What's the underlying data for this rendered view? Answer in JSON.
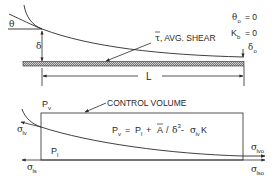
{
  "top_panel": {
    "theta_label": "θ",
    "delta_label": "δ",
    "length_label": "L",
    "shear_symbol": "τ",
    "shear_text": ", AVG. SHEAR",
    "end_conditions": {
      "theta_o": {
        "sym": "θ",
        "sub": "o",
        "eq": "= 0"
      },
      "K_b": {
        "sym": "K",
        "sub": "b",
        "eq": "= 0"
      },
      "delta_o": {
        "sym": "δ",
        "sub": "o"
      }
    }
  },
  "bottom_panel": {
    "control_volume_label": "CONTROL VOLUME",
    "Pv_label": {
      "sym": "P",
      "sub": "v"
    },
    "Pl_label": {
      "sym": "P",
      "sub": "l"
    },
    "equation": {
      "lhs_sym": "P",
      "lhs_sub": "v",
      "eq1": "=",
      "p_sym": "P",
      "p_sub": "l",
      "plus": "+",
      "A_sym": "A",
      "slash": "/",
      "delta_sym": "δ",
      "delta_pow": "3",
      "minus": "-",
      "sigma_sym": "σ",
      "sigma_sub": "lv",
      "K_sym": "K"
    },
    "stresses": {
      "sigma_lv": {
        "sym": "σ",
        "sub": "lv"
      },
      "sigma_ls": {
        "sym": "σ",
        "sub": "ls"
      },
      "sigma_lvo": {
        "sym": "σ",
        "sub": "lvo"
      },
      "sigma_lso": {
        "sym": "σ",
        "sub": "lso"
      }
    }
  },
  "colors": {
    "line": "#2a2a2a",
    "background": "#ffffff"
  }
}
